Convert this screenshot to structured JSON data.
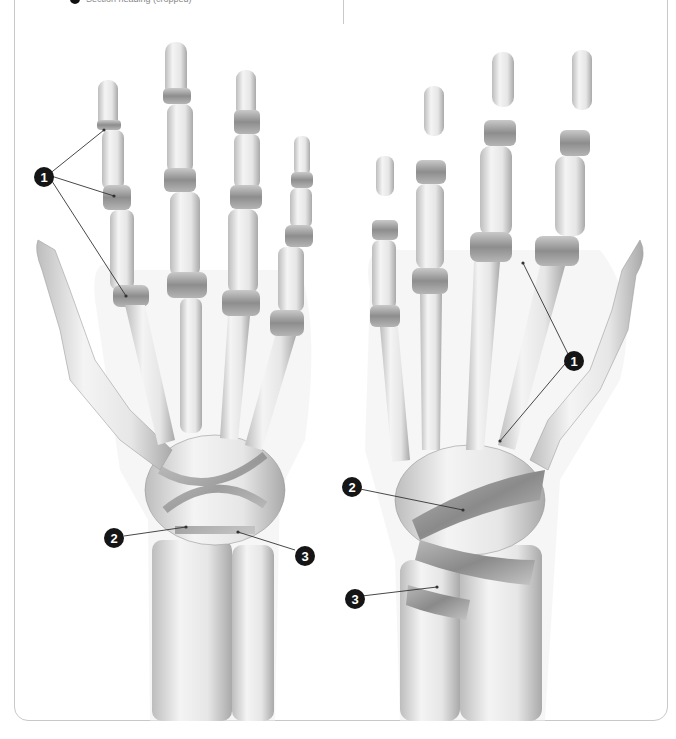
{
  "header": {
    "bullet_icon": "black-dot",
    "text": "Section heading (cropped)"
  },
  "figure": {
    "views": [
      {
        "name": "left-hand-view",
        "callouts": [
          {
            "number": "1",
            "label": "1",
            "targets": 3
          },
          {
            "number": "2",
            "label": "2",
            "targets": 1
          },
          {
            "number": "3",
            "label": "3",
            "targets": 1
          }
        ]
      },
      {
        "name": "right-hand-view",
        "callouts": [
          {
            "number": "1",
            "label": "1",
            "targets": 2
          },
          {
            "number": "2",
            "label": "2",
            "targets": 1
          },
          {
            "number": "3",
            "label": "3",
            "targets": 1
          }
        ]
      }
    ]
  },
  "colors": {
    "bone_light": "#f2f2f2",
    "bone_mid": "#d9d9d9",
    "bone_shadow": "#a8a8a8",
    "ligament": "#8c8c8c",
    "callout_fill": "#151515",
    "frame_border": "#c8c8c8"
  }
}
